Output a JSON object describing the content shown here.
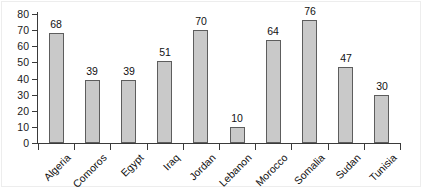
{
  "chart_data": {
    "type": "bar",
    "title": "",
    "subtitle": "",
    "xlabel": "",
    "ylabel": "",
    "categories": [
      "Algeria",
      "Comoros",
      "Egypt",
      "Iraq",
      "Jordan",
      "Lebanon",
      "Morocco",
      "Somalia",
      "Sudan",
      "Tunisia"
    ],
    "values": [
      68,
      39,
      39,
      51,
      70,
      10,
      64,
      76,
      47,
      30
    ],
    "value_labels": [
      "68",
      "39",
      "39",
      "51",
      "70",
      "10",
      "64",
      "76",
      "47",
      "30"
    ],
    "ylim": [
      0,
      80
    ],
    "ytick_labels": [
      "0",
      "10",
      "20",
      "30",
      "40",
      "50",
      "60",
      "70",
      "80"
    ],
    "ytick_values": [
      0,
      10,
      20,
      30,
      40,
      50,
      60,
      70,
      80
    ],
    "grid": false,
    "legend": "none",
    "bar_color": "#c9c9c9",
    "bar_edge_color": "#5d5d5d",
    "axis_color": "#3a3a3a",
    "text_color": "#111111",
    "background": "#ffffff",
    "category_label_rotation": -45
  }
}
